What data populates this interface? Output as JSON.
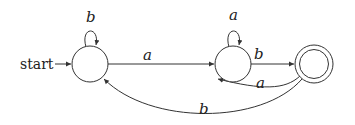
{
  "diagram": {
    "type": "finite-automaton",
    "start_label": "start",
    "states": [
      {
        "id": "q0",
        "accepting": false,
        "initial": true
      },
      {
        "id": "q1",
        "accepting": false,
        "initial": false
      },
      {
        "id": "q2",
        "accepting": true,
        "initial": false
      }
    ],
    "transitions": [
      {
        "from": "q0",
        "to": "q0",
        "label": "b"
      },
      {
        "from": "q0",
        "to": "q1",
        "label": "a"
      },
      {
        "from": "q1",
        "to": "q1",
        "label": "a"
      },
      {
        "from": "q1",
        "to": "q2",
        "label": "b"
      },
      {
        "from": "q2",
        "to": "q1",
        "label": "a"
      },
      {
        "from": "q2",
        "to": "q0",
        "label": "b"
      }
    ]
  }
}
